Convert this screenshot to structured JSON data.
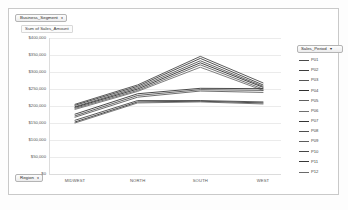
{
  "window": {
    "background": "#ffffff",
    "frame_border": "#c9c9c9"
  },
  "filters": {
    "business_segment": {
      "label": "Business_Segment",
      "caret": "▾"
    },
    "region": {
      "label": "Region",
      "caret": "▾"
    }
  },
  "value_field": {
    "label": "Sum of Sales_Amount"
  },
  "legend": {
    "title": "Sales_Period",
    "caret": "▾",
    "position": "right"
  },
  "chart_data": {
    "type": "line",
    "title": "Sum of Sales_Amount",
    "xlabel": "",
    "ylabel": "",
    "categories": [
      "MIDWEST",
      "NORTH",
      "SOUTH",
      "WEST"
    ],
    "ylim": [
      0,
      400000
    ],
    "yticks": [
      0,
      50000,
      100000,
      150000,
      200000,
      250000,
      300000,
      350000,
      400000
    ],
    "ytick_labels": [
      "$0",
      "$50,000",
      "$100,000",
      "$150,000",
      "$200,000",
      "$250,000",
      "$300,000",
      "$350,000",
      "$400,000"
    ],
    "grid": true,
    "legend_position": "right",
    "legend_title": "Sales_Period",
    "series": [
      {
        "name": "P01",
        "color": "#4a4a4a",
        "values": [
          205000,
          262000,
          346000,
          268000
        ]
      },
      {
        "name": "P02",
        "color": "#3d3d3d",
        "values": [
          202000,
          258000,
          340000,
          262000
        ]
      },
      {
        "name": "P03",
        "color": "#555555",
        "values": [
          198000,
          254000,
          333000,
          258000
        ]
      },
      {
        "name": "P04",
        "color": "#2f2f2f",
        "values": [
          196000,
          250000,
          327000,
          255000
        ]
      },
      {
        "name": "P05",
        "color": "#606060",
        "values": [
          193000,
          246000,
          321000,
          250000
        ]
      },
      {
        "name": "P06",
        "color": "#707070",
        "values": [
          190000,
          243000,
          314000,
          246000
        ]
      },
      {
        "name": "P07",
        "color": "#353535",
        "values": [
          176000,
          236000,
          252000,
          251000
        ]
      },
      {
        "name": "P08",
        "color": "#4f4f4f",
        "values": [
          171000,
          231000,
          248000,
          246000
        ]
      },
      {
        "name": "P09",
        "color": "#5d5d5d",
        "values": [
          167000,
          226000,
          244000,
          240000
        ]
      },
      {
        "name": "P10",
        "color": "#464646",
        "values": [
          158000,
          216000,
          216000,
          212000
        ]
      },
      {
        "name": "P11",
        "color": "#383838",
        "values": [
          153000,
          212000,
          214000,
          209000
        ]
      },
      {
        "name": "P12",
        "color": "#6a6a6a",
        "values": [
          150000,
          209000,
          212000,
          206000
        ]
      }
    ]
  }
}
